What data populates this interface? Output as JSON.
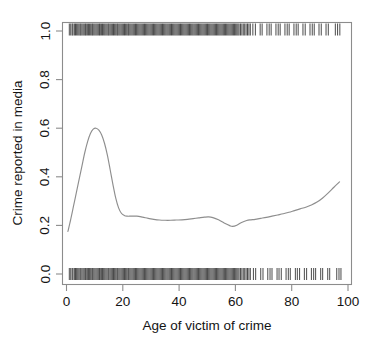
{
  "chart_data": {
    "type": "line",
    "title": "",
    "subtitle": "",
    "xlabel": "Age of victim of crime",
    "ylabel": "Crime reported in media",
    "xlim": [
      0,
      100
    ],
    "ylim": [
      0.0,
      1.0
    ],
    "xticks": [
      0,
      20,
      40,
      60,
      80,
      100
    ],
    "xtick_labels": [
      "0",
      "20",
      "40",
      "60",
      "80",
      "100"
    ],
    "yticks": [
      0.0,
      0.2,
      0.4,
      0.6,
      0.8,
      1.0
    ],
    "ytick_labels": [
      "0.0",
      "0.2",
      "0.4",
      "0.6",
      "0.8",
      "1.0"
    ],
    "grid": false,
    "legend": null,
    "annotations": [],
    "series": [
      {
        "name": "Smoothed probability crime reported in media",
        "type": "line",
        "color": "#8e8e8e",
        "x": [
          0.5,
          1.5,
          2.5,
          3.5,
          4.5,
          5.5,
          6.5,
          7.5,
          8.5,
          9.5,
          10.5,
          11.5,
          12.5,
          13.5,
          14.5,
          15.5,
          16.5,
          17.5,
          18.5,
          19.5,
          20.5,
          21.5,
          23,
          25,
          27,
          29,
          31,
          33,
          35,
          37,
          39,
          41,
          43,
          45,
          47,
          49,
          50.5,
          52,
          54,
          56,
          58,
          59,
          60.5,
          62,
          64,
          65.5,
          67,
          69,
          71,
          73,
          75,
          77,
          79,
          81,
          83,
          85,
          87,
          89,
          91,
          93,
          95,
          97
        ],
        "y": [
          0.175,
          0.225,
          0.28,
          0.335,
          0.39,
          0.445,
          0.5,
          0.545,
          0.578,
          0.596,
          0.6,
          0.592,
          0.572,
          0.538,
          0.49,
          0.43,
          0.368,
          0.312,
          0.272,
          0.25,
          0.241,
          0.238,
          0.238,
          0.238,
          0.234,
          0.229,
          0.225,
          0.222,
          0.221,
          0.221,
          0.222,
          0.223,
          0.225,
          0.228,
          0.231,
          0.234,
          0.235,
          0.232,
          0.223,
          0.21,
          0.199,
          0.196,
          0.201,
          0.211,
          0.22,
          0.223,
          0.225,
          0.229,
          0.233,
          0.238,
          0.243,
          0.248,
          0.254,
          0.261,
          0.268,
          0.275,
          0.284,
          0.296,
          0.313,
          0.334,
          0.357,
          0.379
        ]
      },
      {
        "name": "Rug: crime reported in media (value 1)",
        "type": "rug",
        "position": "top",
        "y_value": 1.0,
        "x": [
          1,
          1.5,
          2,
          2.3,
          2.8,
          3.2,
          3.6,
          4,
          4.4,
          4.8,
          5.1,
          5.5,
          5.9,
          6.3,
          6.7,
          7,
          7.4,
          7.8,
          8.2,
          8.6,
          9,
          9.3,
          9.7,
          10.1,
          10.5,
          10.9,
          11.3,
          11.7,
          12,
          12.4,
          12.8,
          13.2,
          13.6,
          14,
          14.4,
          14.8,
          15.1,
          15.5,
          15.9,
          16.3,
          16.7,
          17.1,
          17.5,
          17.9,
          18.2,
          18.6,
          19,
          19.4,
          19.8,
          20.2,
          20.6,
          21,
          21.4,
          21.8,
          22.1,
          22.5,
          22.9,
          23.3,
          23.7,
          24.1,
          24.5,
          24.9,
          25.3,
          25.7,
          26.1,
          26.5,
          26.9,
          27.3,
          27.7,
          28.1,
          28.5,
          28.9,
          29.3,
          29.7,
          30.1,
          30.5,
          30.9,
          31.3,
          31.7,
          32.1,
          32.5,
          32.9,
          33.3,
          33.7,
          34.1,
          34.5,
          34.9,
          35.3,
          35.7,
          36.1,
          36.5,
          36.9,
          37.3,
          37.7,
          38.1,
          38.5,
          38.9,
          39.3,
          39.7,
          40.1,
          40.5,
          40.9,
          41.3,
          41.7,
          42.1,
          42.5,
          42.9,
          43.3,
          43.7,
          44.1,
          44.5,
          44.9,
          45.3,
          45.7,
          46.1,
          46.5,
          46.9,
          47.3,
          47.7,
          48.1,
          48.5,
          48.9,
          49.3,
          49.7,
          50.1,
          50.5,
          50.9,
          51.3,
          51.7,
          52.1,
          52.5,
          52.9,
          53.3,
          53.7,
          54.1,
          54.5,
          54.9,
          55.3,
          55.7,
          56.1,
          56.5,
          56.9,
          57.3,
          57.7,
          58.1,
          58.5,
          58.9,
          59.3,
          59.7,
          60.1,
          60.5,
          60.9,
          61.3,
          61.8,
          62.3,
          62.8,
          63.3,
          63.8,
          64.3,
          64.8,
          65.3,
          66.2,
          67.1,
          68.8,
          69.5,
          71.2,
          72,
          72.7,
          74.4,
          75.2,
          75.9,
          77.6,
          78.4,
          79.1,
          80.8,
          81.6,
          82.3,
          84,
          84.8,
          86.5,
          87.3,
          88,
          89.7,
          90.5,
          92.2,
          93,
          95.5,
          96.3,
          97.1
        ],
        "note": "dense from age 1 to 65, sparse grouped ticks from 66 to 97"
      },
      {
        "name": "Rug: crime not reported in media (value 0)",
        "type": "rug",
        "position": "bottom",
        "y_value": 0.0,
        "x": [
          1,
          1.5,
          2,
          2.3,
          2.8,
          3.2,
          3.6,
          4,
          4.4,
          4.8,
          5.1,
          5.5,
          5.9,
          6.3,
          6.7,
          7,
          7.4,
          7.8,
          8.2,
          8.6,
          9,
          9.3,
          9.7,
          10.1,
          10.5,
          10.9,
          11.3,
          11.7,
          12,
          12.4,
          12.8,
          13.2,
          13.6,
          14,
          14.4,
          14.8,
          15.1,
          15.5,
          15.9,
          16.3,
          16.7,
          17.1,
          17.5,
          17.9,
          18.2,
          18.6,
          19,
          19.4,
          19.8,
          20.2,
          20.6,
          21,
          21.4,
          21.8,
          22.1,
          22.5,
          22.9,
          23.3,
          23.7,
          24.1,
          24.5,
          24.9,
          25.3,
          25.7,
          26.1,
          26.5,
          26.9,
          27.3,
          27.7,
          28.1,
          28.5,
          28.9,
          29.3,
          29.7,
          30.1,
          30.5,
          30.9,
          31.3,
          31.7,
          32.1,
          32.5,
          32.9,
          33.3,
          33.7,
          34.1,
          34.5,
          34.9,
          35.3,
          35.7,
          36.1,
          36.5,
          36.9,
          37.3,
          37.7,
          38.1,
          38.5,
          38.9,
          39.3,
          39.7,
          40.1,
          40.5,
          40.9,
          41.3,
          41.7,
          42.1,
          42.5,
          42.9,
          43.3,
          43.7,
          44.1,
          44.5,
          44.9,
          45.3,
          45.7,
          46.1,
          46.5,
          46.9,
          47.3,
          47.7,
          48.1,
          48.5,
          48.9,
          49.3,
          49.7,
          50.1,
          50.5,
          50.9,
          51.3,
          51.7,
          52.1,
          52.5,
          52.9,
          53.3,
          53.7,
          54.1,
          54.5,
          54.9,
          55.3,
          55.7,
          56.1,
          56.5,
          56.9,
          57.3,
          57.7,
          58.1,
          58.5,
          58.9,
          59.3,
          59.7,
          60.1,
          60.5,
          60.9,
          61.3,
          61.8,
          62.3,
          62.8,
          63.3,
          63.8,
          64.3,
          64.8,
          65.3,
          66.4,
          67.2,
          69,
          69.8,
          71.5,
          72.3,
          73,
          74.8,
          75.5,
          76.3,
          78,
          78.8,
          79.5,
          81.3,
          82,
          82.8,
          84.5,
          85.3,
          87,
          87.8,
          88.5,
          90.3,
          91,
          92.8,
          93.5,
          96,
          96.8,
          97.5
        ],
        "note": "dense from age 1 to 65, sparse grouped ticks from 66 to 97"
      }
    ]
  },
  "style": {
    "axis_color": "#8c8c8c",
    "curve_color": "#8e8e8e",
    "rug_color": "#2b2b2b",
    "text_color": "#141414",
    "background": "#ffffff"
  }
}
